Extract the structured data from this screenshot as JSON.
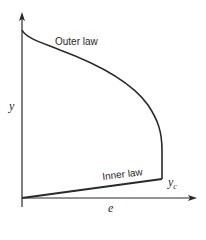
{
  "diagram": {
    "labels": {
      "outer_law": "Outer law",
      "inner_law": "Inner law",
      "y_axis": "y",
      "x_axis": "e",
      "y_c": "y",
      "y_c_sub": "c"
    },
    "colors": {
      "line": "#2a2a2a",
      "background": "#ffffff"
    }
  }
}
